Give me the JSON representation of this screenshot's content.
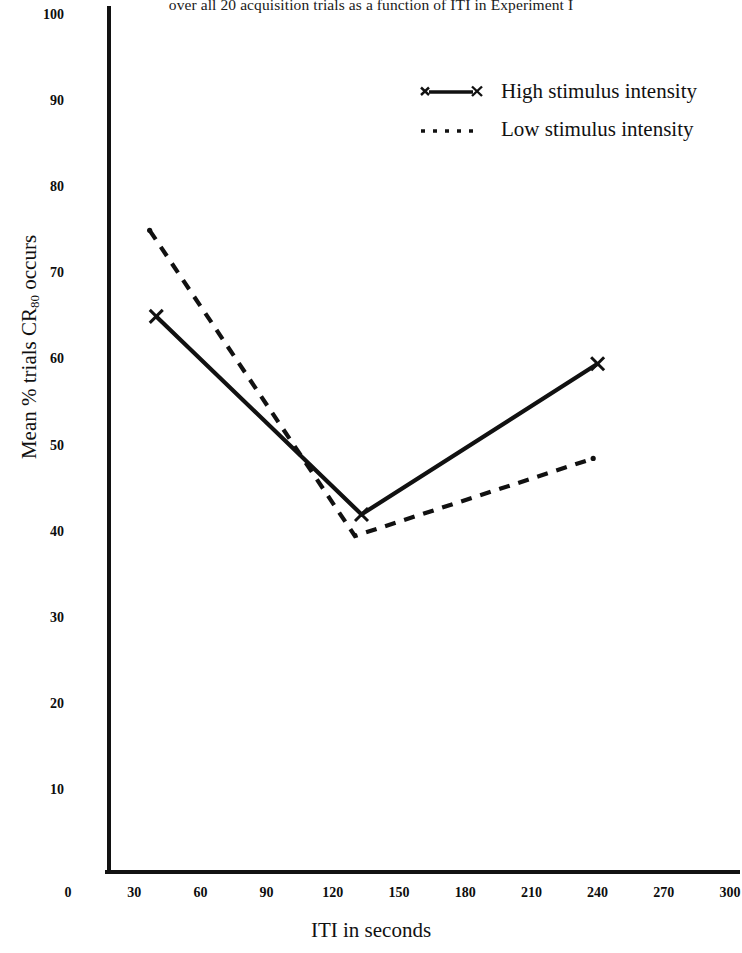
{
  "caption": "over all 20 acquisition trials as a function of ITI in Experiment I",
  "axes": {
    "xlabel": "ITI in seconds",
    "ylabel_main": "Mean % trials CR",
    "ylabel_sub": "80",
    "ylabel_tail": " occurs"
  },
  "legend": {
    "items": [
      {
        "label": "High stimulus intensity",
        "marker": "x-solid-line"
      },
      {
        "label": "Low stimulus intensity",
        "marker": "dotted-line"
      }
    ]
  },
  "chart_data": {
    "type": "line",
    "title": "over all 20 acquisition trials as a function of ITI in Experiment I",
    "xlabel": "ITI in seconds",
    "ylabel": "Mean % trials CR80 occurs",
    "xlim": [
      0,
      300
    ],
    "ylim": [
      0,
      100
    ],
    "xticks": [
      0,
      30,
      60,
      90,
      120,
      150,
      180,
      210,
      240,
      270,
      300
    ],
    "yticks": [
      10,
      20,
      30,
      40,
      50,
      60,
      70,
      80,
      90,
      100
    ],
    "xtick_labels": [
      "0",
      "30",
      "60",
      "90",
      "120",
      "150",
      "180",
      "210",
      "240",
      "270",
      "300"
    ],
    "ytick_labels": [
      "10",
      "20",
      "30",
      "40",
      "50",
      "60",
      "70",
      "80",
      "90",
      "100"
    ],
    "grid": false,
    "legend_position": "top-right",
    "series": [
      {
        "name": "High stimulus intensity",
        "style": "solid",
        "marker": "x",
        "x": [
          40,
          133,
          240
        ],
        "values": [
          65,
          42,
          59.5
        ]
      },
      {
        "name": "Low stimulus intensity",
        "style": "dashed",
        "marker": "none",
        "x": [
          37,
          130,
          238
        ],
        "values": [
          75,
          39.5,
          48.5
        ]
      }
    ]
  }
}
